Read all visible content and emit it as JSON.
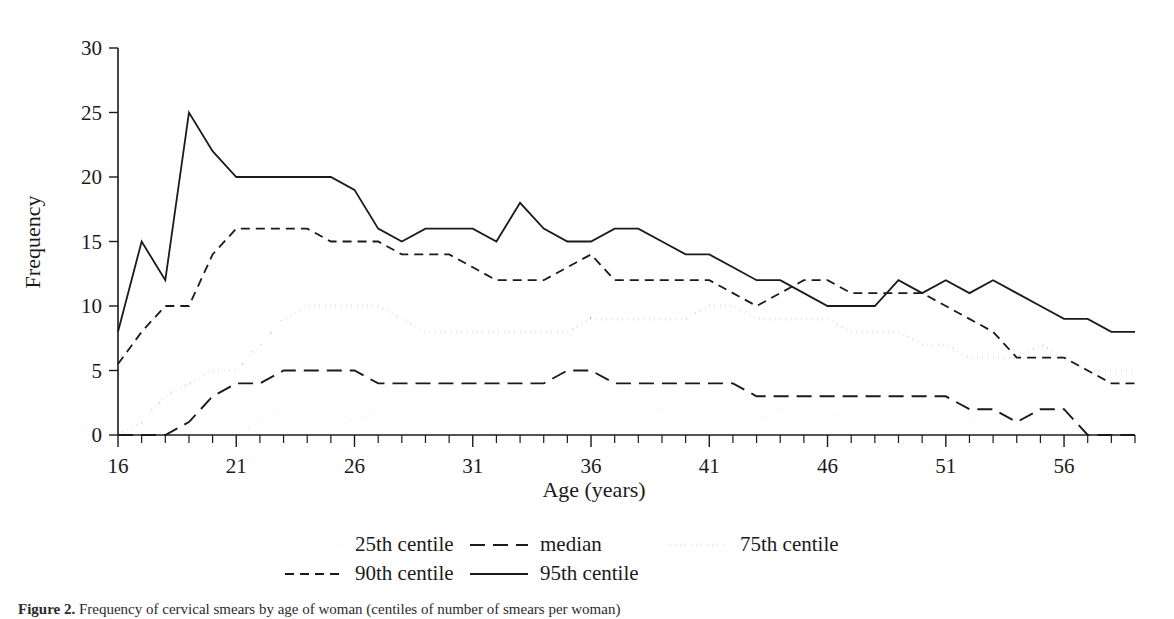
{
  "figure": {
    "caption_label": "Figure 2.",
    "caption_text": "Frequency of cervical smears by age of woman (centiles of number of smears per woman)"
  },
  "chart_data": {
    "type": "line",
    "title": "",
    "subtitle": "",
    "xlabel": "Age (years)",
    "ylabel": "Frequency",
    "xlim": [
      16,
      59
    ],
    "ylim": [
      0,
      30
    ],
    "grid": false,
    "legend_position": "bottom",
    "x_major_ticks": [
      16,
      21,
      26,
      31,
      36,
      41,
      46,
      51,
      56
    ],
    "x_tick_labels": [
      "16",
      "21",
      "26",
      "31",
      "36",
      "41",
      "46",
      "51",
      "56"
    ],
    "x_minor_step": 1,
    "y_ticks": [
      0,
      5,
      10,
      15,
      20,
      25,
      30
    ],
    "y_tick_labels": [
      "0",
      "5",
      "10",
      "15",
      "20",
      "25",
      "30"
    ],
    "x": [
      16,
      17,
      18,
      19,
      20,
      21,
      22,
      23,
      24,
      25,
      26,
      27,
      28,
      29,
      30,
      31,
      32,
      33,
      34,
      35,
      36,
      37,
      38,
      39,
      40,
      41,
      42,
      43,
      44,
      45,
      46,
      47,
      48,
      49,
      50,
      51,
      52,
      53,
      54,
      55,
      56,
      57,
      58,
      59
    ],
    "series": [
      {
        "name": "25th centile",
        "style": "fine-dotted",
        "color": "#b5b5b5",
        "values": [
          0,
          0,
          0,
          0,
          0,
          0,
          1,
          2,
          2,
          2,
          1,
          2,
          2,
          2,
          1,
          1,
          1,
          1,
          1,
          1,
          1,
          2,
          2,
          2,
          1,
          1,
          1,
          1,
          2,
          2,
          2,
          1,
          1,
          1,
          1,
          1,
          1,
          0,
          0,
          0,
          0,
          0,
          0,
          0
        ]
      },
      {
        "name": "median",
        "style": "long-dashed",
        "color": "#1a1a1a",
        "values": [
          0,
          0,
          0,
          1,
          3,
          4,
          4,
          5,
          5,
          5,
          5,
          4,
          4,
          4,
          4,
          4,
          4,
          4,
          4,
          5,
          5,
          4,
          4,
          4,
          4,
          4,
          4,
          3,
          3,
          3,
          3,
          3,
          3,
          3,
          3,
          3,
          2,
          2,
          1,
          2,
          2,
          0,
          0,
          0
        ]
      },
      {
        "name": "75th centile",
        "style": "dotted",
        "color": "#1a1a1a",
        "values": [
          0,
          1,
          3,
          4,
          5,
          5,
          7,
          9,
          10,
          10,
          10,
          10,
          9,
          8,
          8,
          8,
          8,
          8,
          8,
          8,
          9,
          9,
          9,
          9,
          9,
          10,
          10,
          9,
          9,
          9,
          9,
          8,
          8,
          8,
          7,
          7,
          6,
          6,
          6,
          7,
          6,
          5,
          5,
          5
        ]
      },
      {
        "name": "90th centile",
        "style": "dashed",
        "color": "#1a1a1a",
        "values": [
          5.5,
          8,
          10,
          10,
          14,
          16,
          16,
          16,
          16,
          15,
          15,
          15,
          14,
          14,
          14,
          13,
          12,
          12,
          12,
          13,
          14,
          12,
          12,
          12,
          12,
          12,
          11,
          10,
          11,
          12,
          12,
          11,
          11,
          11,
          11,
          10,
          9,
          8,
          6,
          6,
          6,
          5,
          4,
          4
        ]
      },
      {
        "name": "95th centile",
        "style": "solid",
        "color": "#1a1a1a",
        "values": [
          8,
          15,
          12,
          25,
          22,
          20,
          20,
          20,
          20,
          20,
          19,
          16,
          15,
          16,
          16,
          16,
          15,
          18,
          16,
          15,
          15,
          16,
          16,
          15,
          14,
          14,
          13,
          12,
          12,
          11,
          10,
          10,
          10,
          12,
          11,
          12,
          11,
          12,
          11,
          10,
          9,
          9,
          8,
          8
        ]
      }
    ]
  },
  "legend": {
    "entries": [
      {
        "label": "25th centile",
        "style": "fine-dotted"
      },
      {
        "label": "median",
        "style": "long-dashed"
      },
      {
        "label": "75th centile",
        "style": "dotted"
      },
      {
        "label": "90th centile",
        "style": "dashed"
      },
      {
        "label": "95th centile",
        "style": "solid"
      }
    ]
  }
}
